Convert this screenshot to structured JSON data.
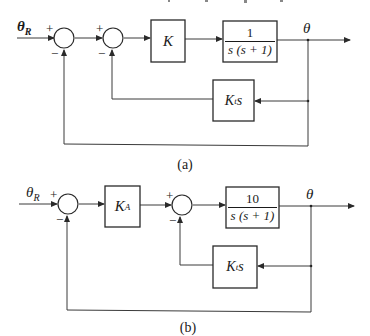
{
  "diagrams": {
    "a": {
      "caption": "(a)",
      "input_label": "θ",
      "input_sub": "R",
      "output_label": "θ",
      "sum1": {
        "plus": "+",
        "minus": "−"
      },
      "sum2": {
        "plus": "+",
        "minus": "−"
      },
      "gain_block": {
        "text": "K"
      },
      "plant_block": {
        "numerator": "1",
        "denominator": "s (s + 1)"
      },
      "feedback_block": {
        "main": "K",
        "sub": "t",
        "tail": "s"
      }
    },
    "b": {
      "caption": "(b)",
      "input_label": "θ",
      "input_sub": "R",
      "output_label": "θ",
      "sum1": {
        "plus": "+",
        "minus": "−"
      },
      "sum2": {
        "plus": "+",
        "minus": "−"
      },
      "gain_block": {
        "main": "K",
        "sub": "A"
      },
      "plant_block": {
        "numerator": "10",
        "denominator": "s (s + 1)"
      },
      "feedback_block": {
        "main": "K",
        "sub": "t",
        "tail": "s"
      }
    }
  },
  "colors": {
    "line": "#3a3a3a",
    "background": "#ffffff"
  }
}
